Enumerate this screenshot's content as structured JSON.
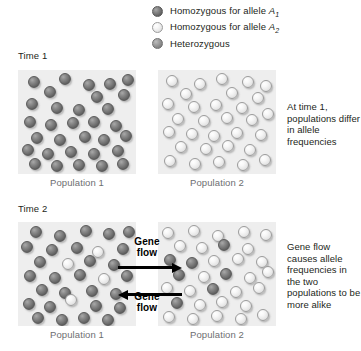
{
  "legend": {
    "items": [
      {
        "icon": "dark-sphere-icon",
        "type": "dark",
        "label_prefix": "Homozygous for allele ",
        "allele": "A",
        "subscript": "1"
      },
      {
        "icon": "light-sphere-icon",
        "type": "light",
        "label_prefix": "Homozygous for allele ",
        "allele": "A",
        "subscript": "2"
      },
      {
        "icon": "hetero-sphere-icon",
        "type": "hetero",
        "label_prefix": "Heterozygous",
        "allele": "",
        "subscript": ""
      }
    ]
  },
  "time1": {
    "label": "Time 1",
    "population1": {
      "caption": "Population 1",
      "individuals": [
        {
          "t": "dark",
          "x": 10,
          "y": 6
        },
        {
          "t": "dark",
          "x": 41,
          "y": 3
        },
        {
          "t": "dark",
          "x": 65,
          "y": 9
        },
        {
          "t": "dark",
          "x": 86,
          "y": 8
        },
        {
          "t": "dark",
          "x": 104,
          "y": 4
        },
        {
          "t": "dark",
          "x": 26,
          "y": 16
        },
        {
          "t": "dark",
          "x": 73,
          "y": 21
        },
        {
          "t": "dark",
          "x": 100,
          "y": 19
        },
        {
          "t": "dark",
          "x": 8,
          "y": 28
        },
        {
          "t": "dark",
          "x": 33,
          "y": 32
        },
        {
          "t": "dark",
          "x": 55,
          "y": 34
        },
        {
          "t": "dark",
          "x": 84,
          "y": 33
        },
        {
          "t": "dark",
          "x": 6,
          "y": 46
        },
        {
          "t": "dark",
          "x": 27,
          "y": 49
        },
        {
          "t": "dark",
          "x": 49,
          "y": 47
        },
        {
          "t": "dark",
          "x": 70,
          "y": 46
        },
        {
          "t": "dark",
          "x": 92,
          "y": 50
        },
        {
          "t": "dark",
          "x": 13,
          "y": 62
        },
        {
          "t": "dark",
          "x": 36,
          "y": 64
        },
        {
          "t": "dark",
          "x": 61,
          "y": 61
        },
        {
          "t": "dark",
          "x": 80,
          "y": 64
        },
        {
          "t": "dark",
          "x": 102,
          "y": 60
        },
        {
          "t": "dark",
          "x": 4,
          "y": 74
        },
        {
          "t": "dark",
          "x": 24,
          "y": 78
        },
        {
          "t": "dark",
          "x": 47,
          "y": 76
        },
        {
          "t": "dark",
          "x": 70,
          "y": 78
        },
        {
          "t": "dark",
          "x": 94,
          "y": 75
        },
        {
          "t": "dark",
          "x": 11,
          "y": 88
        },
        {
          "t": "dark",
          "x": 33,
          "y": 90
        },
        {
          "t": "dark",
          "x": 55,
          "y": 89
        },
        {
          "t": "dark",
          "x": 78,
          "y": 90
        },
        {
          "t": "dark",
          "x": 99,
          "y": 88
        }
      ]
    },
    "population2": {
      "caption": "Population 2",
      "individuals": [
        {
          "t": "light",
          "x": 8,
          "y": 5
        },
        {
          "t": "light",
          "x": 36,
          "y": 8
        },
        {
          "t": "light",
          "x": 58,
          "y": 3
        },
        {
          "t": "light",
          "x": 84,
          "y": 6
        },
        {
          "t": "light",
          "x": 102,
          "y": 10
        },
        {
          "t": "light",
          "x": 22,
          "y": 18
        },
        {
          "t": "light",
          "x": 68,
          "y": 17
        },
        {
          "t": "light",
          "x": 94,
          "y": 22
        },
        {
          "t": "light",
          "x": 4,
          "y": 28
        },
        {
          "t": "light",
          "x": 30,
          "y": 31
        },
        {
          "t": "light",
          "x": 52,
          "y": 29
        },
        {
          "t": "light",
          "x": 78,
          "y": 32
        },
        {
          "t": "light",
          "x": 14,
          "y": 43
        },
        {
          "t": "light",
          "x": 40,
          "y": 45
        },
        {
          "t": "light",
          "x": 63,
          "y": 42
        },
        {
          "t": "light",
          "x": 88,
          "y": 44
        },
        {
          "t": "light",
          "x": 104,
          "y": 38
        },
        {
          "t": "light",
          "x": 5,
          "y": 56
        },
        {
          "t": "light",
          "x": 28,
          "y": 58
        },
        {
          "t": "light",
          "x": 50,
          "y": 60
        },
        {
          "t": "light",
          "x": 73,
          "y": 57
        },
        {
          "t": "light",
          "x": 97,
          "y": 59
        },
        {
          "t": "light",
          "x": 17,
          "y": 71
        },
        {
          "t": "light",
          "x": 42,
          "y": 73
        },
        {
          "t": "light",
          "x": 64,
          "y": 70
        },
        {
          "t": "light",
          "x": 86,
          "y": 74
        },
        {
          "t": "light",
          "x": 6,
          "y": 85
        },
        {
          "t": "light",
          "x": 31,
          "y": 88
        },
        {
          "t": "light",
          "x": 55,
          "y": 86
        },
        {
          "t": "light",
          "x": 79,
          "y": 89
        },
        {
          "t": "light",
          "x": 101,
          "y": 84
        }
      ]
    },
    "side_caption": "At time 1, populations differ in allele frequencies"
  },
  "time2": {
    "label": "Time 2",
    "population1": {
      "caption": "Population 1",
      "individuals": [
        {
          "t": "dark",
          "x": 12,
          "y": 4
        },
        {
          "t": "dark",
          "x": 36,
          "y": 8
        },
        {
          "t": "dark",
          "x": 62,
          "y": 3
        },
        {
          "t": "dark",
          "x": 85,
          "y": 6
        },
        {
          "t": "dark",
          "x": 105,
          "y": 4
        },
        {
          "t": "dark",
          "x": 3,
          "y": 19
        },
        {
          "t": "dark",
          "x": 28,
          "y": 22
        },
        {
          "t": "dark",
          "x": 53,
          "y": 20
        },
        {
          "t": "light",
          "x": 74,
          "y": 24
        },
        {
          "t": "dark",
          "x": 99,
          "y": 21
        },
        {
          "t": "dark",
          "x": 16,
          "y": 34
        },
        {
          "t": "light",
          "x": 44,
          "y": 36
        },
        {
          "t": "dark",
          "x": 66,
          "y": 33
        },
        {
          "t": "dark",
          "x": 90,
          "y": 37
        },
        {
          "t": "dark",
          "x": 6,
          "y": 48
        },
        {
          "t": "dark",
          "x": 31,
          "y": 50
        },
        {
          "t": "dark",
          "x": 56,
          "y": 47
        },
        {
          "t": "light",
          "x": 80,
          "y": 51
        },
        {
          "t": "dark",
          "x": 103,
          "y": 48
        },
        {
          "t": "dark",
          "x": 18,
          "y": 62
        },
        {
          "t": "dark",
          "x": 41,
          "y": 65
        },
        {
          "t": "light",
          "x": 47,
          "y": 72
        },
        {
          "t": "dark",
          "x": 68,
          "y": 63
        },
        {
          "t": "dark",
          "x": 92,
          "y": 66
        },
        {
          "t": "dark",
          "x": 5,
          "y": 76
        },
        {
          "t": "dark",
          "x": 26,
          "y": 79
        },
        {
          "t": "dark",
          "x": 72,
          "y": 78
        },
        {
          "t": "dark",
          "x": 96,
          "y": 80
        },
        {
          "t": "dark",
          "x": 14,
          "y": 90
        },
        {
          "t": "dark",
          "x": 38,
          "y": 92
        },
        {
          "t": "dark",
          "x": 60,
          "y": 90
        },
        {
          "t": "dark",
          "x": 84,
          "y": 92
        }
      ]
    },
    "population2": {
      "caption": "Population 2",
      "individuals": [
        {
          "t": "light",
          "x": 4,
          "y": 5
        },
        {
          "t": "light",
          "x": 30,
          "y": 3
        },
        {
          "t": "light",
          "x": 54,
          "y": 8
        },
        {
          "t": "light",
          "x": 80,
          "y": 4
        },
        {
          "t": "light",
          "x": 102,
          "y": 7
        },
        {
          "t": "light",
          "x": 16,
          "y": 18
        },
        {
          "t": "light",
          "x": 38,
          "y": 20
        },
        {
          "t": "dark",
          "x": 60,
          "y": 17
        },
        {
          "t": "light",
          "x": 84,
          "y": 21
        },
        {
          "t": "dark",
          "x": 6,
          "y": 32
        },
        {
          "t": "dark",
          "x": 28,
          "y": 35
        },
        {
          "t": "light",
          "x": 50,
          "y": 33
        },
        {
          "t": "light",
          "x": 74,
          "y": 31
        },
        {
          "t": "light",
          "x": 98,
          "y": 34
        },
        {
          "t": "dark",
          "x": 15,
          "y": 47
        },
        {
          "t": "light",
          "x": 40,
          "y": 49
        },
        {
          "t": "dark",
          "x": 62,
          "y": 46
        },
        {
          "t": "light",
          "x": 86,
          "y": 50
        },
        {
          "t": "light",
          "x": 104,
          "y": 44
        },
        {
          "t": "light",
          "x": 3,
          "y": 60
        },
        {
          "t": "light",
          "x": 26,
          "y": 63
        },
        {
          "t": "dark",
          "x": 49,
          "y": 61
        },
        {
          "t": "light",
          "x": 72,
          "y": 64
        },
        {
          "t": "light",
          "x": 95,
          "y": 60
        },
        {
          "t": "dark",
          "x": 13,
          "y": 75
        },
        {
          "t": "light",
          "x": 36,
          "y": 77
        },
        {
          "t": "light",
          "x": 58,
          "y": 74
        },
        {
          "t": "light",
          "x": 82,
          "y": 78
        },
        {
          "t": "light",
          "x": 5,
          "y": 89
        },
        {
          "t": "light",
          "x": 29,
          "y": 91
        },
        {
          "t": "light",
          "x": 53,
          "y": 88
        },
        {
          "t": "light",
          "x": 77,
          "y": 91
        },
        {
          "t": "light",
          "x": 99,
          "y": 87
        }
      ]
    },
    "arrow_top_label": "Gene\nflow",
    "arrow_bottom_label": "Gene\nflow",
    "side_caption": "Gene flow causes allele frequencies in the two populations to be more alike"
  }
}
